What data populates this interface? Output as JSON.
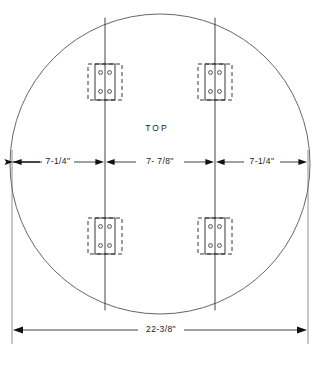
{
  "drawing": {
    "title": "TOP",
    "view_label": "TOP",
    "background_color": "#ffffff",
    "line_color": "#1a1a1a",
    "outline_color": "#555555",
    "canvas": {
      "width": 319,
      "height": 366
    },
    "part": {
      "shape": "circle",
      "name": "round-table-top",
      "center_x": 160,
      "center_y": 164,
      "radius": 150,
      "overall_diameter": "22-3/8\""
    },
    "rails": [
      {
        "name": "left-rail-line",
        "x": 105
      },
      {
        "name": "right-rail-line",
        "x": 215
      }
    ],
    "hinges": [
      {
        "name": "hinge-top-left",
        "cx": 105,
        "cy": 82,
        "holes": 4
      },
      {
        "name": "hinge-top-right",
        "cx": 215,
        "cy": 82,
        "holes": 4
      },
      {
        "name": "hinge-bottom-left",
        "cx": 105,
        "cy": 236,
        "holes": 4
      },
      {
        "name": "hinge-bottom-right",
        "cx": 215,
        "cy": 236,
        "holes": 4
      }
    ],
    "dimensions": {
      "chain_y": 162,
      "segments": [
        {
          "name": "dimension-left",
          "label": "7-1/4\"",
          "x1": 12,
          "x2": 105,
          "text_x": 58
        },
        {
          "name": "dimension-center",
          "label": "7- 7/8\"",
          "x1": 105,
          "x2": 215,
          "text_x": 160
        },
        {
          "name": "dimension-right",
          "label": "7-1/4\"",
          "x1": 215,
          "x2": 308,
          "text_x": 262
        }
      ],
      "overall": {
        "name": "dimension-overall",
        "label": "22-3/8\"",
        "y": 330,
        "x1": 12,
        "x2": 308,
        "text_x": 160
      }
    }
  }
}
